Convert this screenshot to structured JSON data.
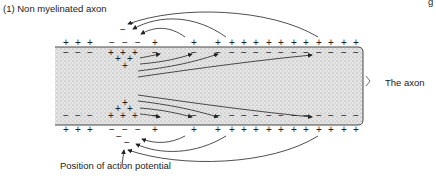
{
  "figure": {
    "title": "(1) Non myelinated axon",
    "axon_label": "The axon",
    "action_potential_label": "Position of action potential",
    "corner_fragment": "g"
  },
  "diagram": {
    "axon": {
      "x": 55,
      "y": 47,
      "width": 127,
      "height": 77,
      "fill": "#d8d8d8",
      "stroke": "#333333"
    },
    "charges": {
      "outside_top_resting": "+ + +",
      "outside_top_depolarized": "− − −",
      "inside_top_resting": "− − −",
      "inside_top_depolarized": "+ + +",
      "outside_bottom_resting": "+ + +",
      "outside_bottom_depolarized": "− − −"
    },
    "current_arrows": "local circuit currents flowing from depolarized region to adjacent resting membrane, inside and outside the axon"
  }
}
